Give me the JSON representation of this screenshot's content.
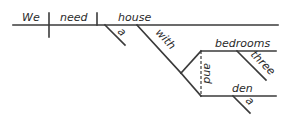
{
  "diagram": {
    "type": "sentence-diagram",
    "sentence": "We need a house with three bedrooms and a den",
    "colors": {
      "line": "#3a3a3a",
      "text": "#2a2a2a",
      "background": "#ffffff"
    },
    "words": {
      "subject": "We",
      "verb": "need",
      "object": "house",
      "object_article": "a",
      "preposition": "with",
      "compound_object_1": "bedrooms",
      "compound_object_1_modifier": "three",
      "conjunction": "and",
      "compound_object_2": "den",
      "compound_object_2_article": "a"
    }
  }
}
